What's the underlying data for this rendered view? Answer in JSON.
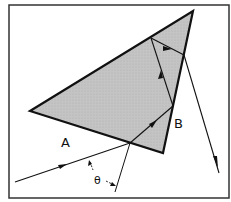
{
  "diagram": {
    "labels": {
      "face_a": "A",
      "face_b": "B",
      "angle": "θ"
    },
    "colors": {
      "prism_fill": "#bdbdbd",
      "line": "#111111",
      "frame": "#333333",
      "background": "#ffffff"
    }
  }
}
